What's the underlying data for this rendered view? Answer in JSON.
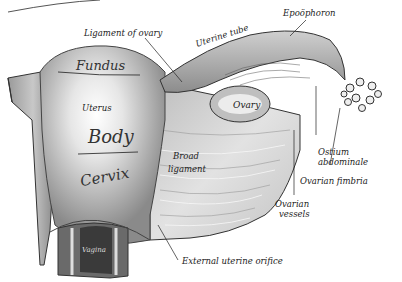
{
  "figure": {
    "labels": {
      "ligament_of_ovary": "Ligament of ovary",
      "uterine_tube": "Uterine tube",
      "epoophoron": "Epoöphoron",
      "ovary": "Ovary",
      "uterus": "Uterus",
      "broad_ligament_1": "Broad",
      "broad_ligament_2": "ligament",
      "ostium_1": "Ostium",
      "ostium_2": "abdominale",
      "ovarian_fimbria": "Ovarian fimbria",
      "ovarian_vessels_1": "Ovarian",
      "ovarian_vessels_2": "vessels",
      "vagina": "Vagina",
      "external_uterine_orifice": "External uterine orifice"
    },
    "handwritten": {
      "fundus": "Fundus",
      "body": "Body",
      "cervix": "Cervix"
    },
    "colors": {
      "background": "#ffffff",
      "tissue_light": "#d8d8d8",
      "tissue_mid": "#a8a8a8",
      "tissue_dark": "#4a4a4a",
      "ink": "#222222"
    }
  }
}
